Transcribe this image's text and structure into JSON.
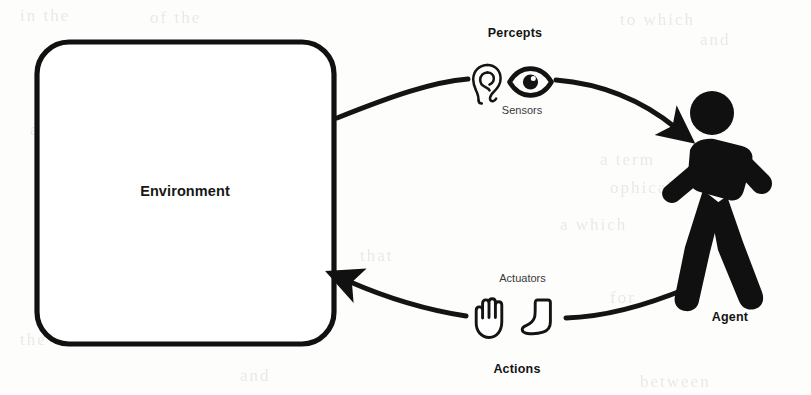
{
  "diagram": {
    "type": "cycle-diagram",
    "stroke_color": "#111111",
    "background_color": "#fdfdfc",
    "environment": {
      "label": "Environment",
      "shape": "rounded-rectangle"
    },
    "agent": {
      "label": "Agent",
      "icon": "walking-person-icon"
    },
    "top_path": {
      "label": "Percepts",
      "sublabel": "Sensors",
      "direction": "environment-to-agent",
      "icons": [
        "ear-icon",
        "eye-icon"
      ]
    },
    "bottom_path": {
      "label": "Actions",
      "sublabel": "Actuators",
      "direction": "agent-to-environment",
      "icons": [
        "hand-icon",
        "foot-icon"
      ]
    },
    "ghost_text": [
      {
        "text": "in the",
        "x": 20,
        "y": 6
      },
      {
        "text": "of the",
        "x": 150,
        "y": 8
      },
      {
        "text": "to which",
        "x": 620,
        "y": 10
      },
      {
        "text": "and",
        "x": 700,
        "y": 30
      },
      {
        "text": "a from",
        "x": 30,
        "y": 120
      },
      {
        "text": "a term",
        "x": 600,
        "y": 150
      },
      {
        "text": "ophical",
        "x": 610,
        "y": 178
      },
      {
        "text": "a which",
        "x": 560,
        "y": 215
      },
      {
        "text": "that",
        "x": 360,
        "y": 246
      },
      {
        "text": "not",
        "x": 175,
        "y": 285
      },
      {
        "text": "for",
        "x": 610,
        "y": 288
      },
      {
        "text": "the",
        "x": 20,
        "y": 330
      },
      {
        "text": "and",
        "x": 240,
        "y": 366
      },
      {
        "text": "between",
        "x": 640,
        "y": 372
      }
    ]
  }
}
